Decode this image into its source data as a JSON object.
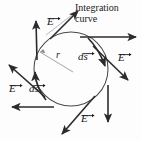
{
  "figure": {
    "name": "integration-curve-electric-field-diagram",
    "background_color": "#fdfdfd",
    "ink_color": "#2b2b2b",
    "caption": {
      "line1": "Integration",
      "line2": "curve"
    },
    "radius_label": "r",
    "field_symbol": "E",
    "path_element_symbol": "ds",
    "labels": [
      {
        "id": "E-top-left",
        "text": "E",
        "type": "field",
        "x": 49,
        "y": 22
      },
      {
        "id": "E-right",
        "text": "E",
        "type": "field",
        "x": 119,
        "y": 58
      },
      {
        "id": "E-left",
        "text": "E",
        "type": "field",
        "x": 10,
        "y": 89
      },
      {
        "id": "E-bottom",
        "text": "E",
        "type": "field",
        "x": 82,
        "y": 119
      },
      {
        "id": "ds-right",
        "text": "ds",
        "type": "path-element",
        "x": 81,
        "y": 57
      },
      {
        "id": "ds-left",
        "text": "ds",
        "type": "path-element",
        "x": 31,
        "y": 89
      },
      {
        "id": "r-radius",
        "text": "r",
        "type": "radius",
        "x": 56,
        "y": 56
      }
    ],
    "geometry": {
      "circle_center_x": 71,
      "circle_center_y": 69,
      "circle_radius": 37
    },
    "vectors": [
      {
        "id": "E-vector-top-left",
        "kind": "field",
        "direction": "up-right"
      },
      {
        "id": "E-vector-upper-left",
        "kind": "field",
        "direction": "up"
      },
      {
        "id": "E-vector-upper-right",
        "kind": "field",
        "direction": "right"
      },
      {
        "id": "E-vector-right",
        "kind": "field",
        "direction": "down-right"
      },
      {
        "id": "E-vector-bottom-right",
        "kind": "field",
        "direction": "down"
      },
      {
        "id": "E-vector-bottom",
        "kind": "field",
        "direction": "down-left"
      },
      {
        "id": "E-vector-bottom-left",
        "kind": "field",
        "direction": "left"
      },
      {
        "id": "E-vector-left",
        "kind": "field",
        "direction": "up-left"
      },
      {
        "id": "ds-vector-right",
        "kind": "path-element",
        "direction": "tangent-down-right"
      },
      {
        "id": "ds-vector-left",
        "kind": "path-element",
        "direction": "tangent-up-left"
      }
    ]
  }
}
